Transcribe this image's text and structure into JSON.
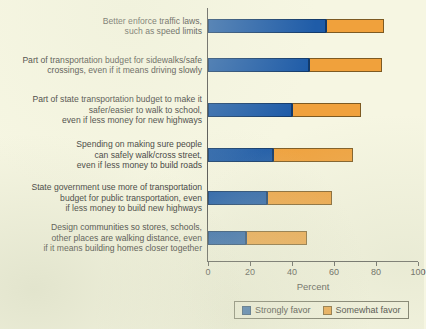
{
  "chart_data": {
    "type": "bar",
    "orientation": "horizontal",
    "stacked": true,
    "title": "",
    "xlabel": "Percent",
    "ylabel": "",
    "xlim": [
      0,
      100
    ],
    "xticks": [
      0,
      20,
      40,
      60,
      80,
      100
    ],
    "xtick_labels": [
      "0",
      "20",
      "40",
      "60",
      "80",
      "100"
    ],
    "grid": false,
    "legend_position": "bottom",
    "colors": {
      "strongly_favor": "#1f5ca8",
      "somewhat_favor": "#f0a13c",
      "background": "#f6f6e2",
      "axis": "#4b4b4b"
    },
    "categories": [
      "Better enforce traffic laws, such as speed limits",
      "Part of transportation budget for sidewalks/safe crossings, even if it means driving slowly",
      "Part of state transportation budget to make it safer/easier to walk to school, even if less money for new highways",
      "Spending on making sure people can safely walk/cross street, even if less money to build roads",
      "State government use more of transportation budget for public transportation, even if less money to build new highways",
      "Design communities so stores, schools, other places are walking distance, even if it means building homes closer together"
    ],
    "series": [
      {
        "name": "Strongly favor",
        "values": [
          56,
          48,
          40,
          31,
          28,
          18
        ]
      },
      {
        "name": "Somewhat favor",
        "values": [
          28,
          35,
          33,
          38,
          31,
          29
        ]
      }
    ],
    "totals": [
      84,
      83,
      73,
      69,
      59,
      47
    ]
  },
  "rows": [
    {
      "label_lines": [
        "Better enforce traffic laws,",
        "such as speed limits"
      ],
      "strongly_favor": 56,
      "somewhat_favor": 28
    },
    {
      "label_lines": [
        "Part of transportation budget for sidewalks/safe",
        "crossings, even if it means driving slowly"
      ],
      "strongly_favor": 48,
      "somewhat_favor": 35
    },
    {
      "label_lines": [
        "Part of state transportation budget to make it",
        "safer/easier to walk to school,",
        "even if less money for new highways"
      ],
      "strongly_favor": 40,
      "somewhat_favor": 33
    },
    {
      "label_lines": [
        "Spending on making sure people",
        "can safely walk/cross street,",
        "even if less money to build roads"
      ],
      "strongly_favor": 31,
      "somewhat_favor": 38
    },
    {
      "label_lines": [
        "State government use more of transportation",
        "budget for public transportation, even",
        "if less money to build new highways"
      ],
      "strongly_favor": 28,
      "somewhat_favor": 31
    },
    {
      "label_lines": [
        "Design communities so stores, schools,",
        "other places are walking distance, even",
        "if it means building homes closer together"
      ],
      "strongly_favor": 18,
      "somewhat_favor": 29
    }
  ],
  "axis": {
    "title": "Percent",
    "ticks": [
      "0",
      "20",
      "40",
      "60",
      "80",
      "100"
    ]
  },
  "legend": {
    "items": [
      {
        "label": "Strongly favor",
        "key": "strong"
      },
      {
        "label": "Somewhat favor",
        "key": "somewhat"
      }
    ]
  }
}
